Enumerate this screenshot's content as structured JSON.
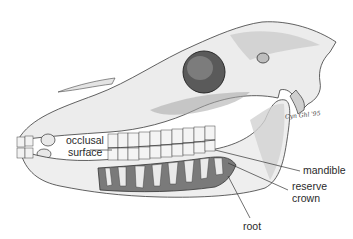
{
  "figure": {
    "colors": {
      "bone": "#ededed",
      "bone_shadow": "#b8b8b8",
      "outline": "#3a3a3a",
      "tooth": "#f4f4f4",
      "jaw_cavity": "#7a7a7a",
      "orbit": "#4a4a4a",
      "label_text": "#2a2a2a",
      "leader_line": "#333333"
    }
  },
  "labels": {
    "occlusal_surface": {
      "line1": "occlusal",
      "line2": "surface"
    },
    "mandible": "mandible",
    "reserve_crown": {
      "line1": "reserve",
      "line2": "crown"
    },
    "root": "root"
  },
  "signature": "Cyn Ghl '95"
}
